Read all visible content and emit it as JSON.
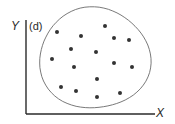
{
  "panel_label": "(d)",
  "axes": {
    "x_label": "X",
    "y_label": "Y"
  },
  "colors": {
    "axis": "#2a2a2a",
    "boundary": "#6a6a6a",
    "point": "#333333",
    "background": "#ffffff"
  },
  "chart_data": {
    "type": "scatter",
    "title": "(d)",
    "xlabel": "X",
    "ylabel": "Y",
    "grid": false,
    "legend": null,
    "annotations": [
      "Closed roughly circular boundary enclosing all points (random / no correlation pattern)"
    ],
    "points_pixel": [
      {
        "x": 57,
        "y": 32
      },
      {
        "x": 81,
        "y": 36
      },
      {
        "x": 105,
        "y": 26
      },
      {
        "x": 114,
        "y": 38
      },
      {
        "x": 129,
        "y": 40
      },
      {
        "x": 71,
        "y": 49
      },
      {
        "x": 96,
        "y": 52
      },
      {
        "x": 52,
        "y": 59
      },
      {
        "x": 74,
        "y": 67
      },
      {
        "x": 114,
        "y": 63
      },
      {
        "x": 132,
        "y": 67
      },
      {
        "x": 97,
        "y": 79
      },
      {
        "x": 61,
        "y": 87
      },
      {
        "x": 76,
        "y": 91
      },
      {
        "x": 97,
        "y": 97
      },
      {
        "x": 120,
        "y": 93
      }
    ],
    "boundary_pixel": {
      "cx": 94.5,
      "cy": 58.5,
      "rx": 54.5,
      "ry": 51.5
    },
    "axes_pixel": {
      "origin_x": 26,
      "origin_y": 114,
      "x_end": 155,
      "y_top": 20
    }
  }
}
